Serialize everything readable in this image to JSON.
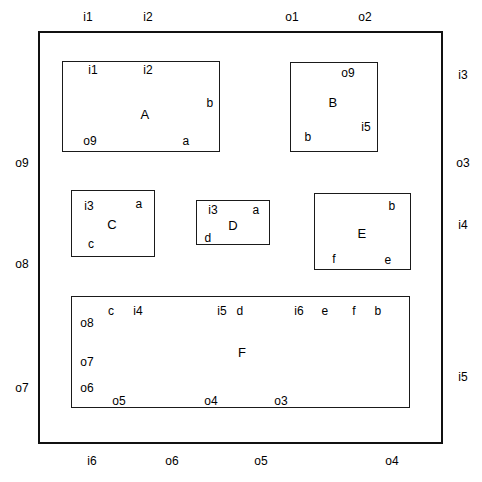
{
  "diagram": {
    "canvas": {
      "width": 482,
      "height": 482,
      "background": "#ffffff"
    },
    "line_color": "#1a1a1a",
    "text_color": "#000000",
    "outer_frame": {
      "name": "outer-frame",
      "x": 38,
      "y": 31,
      "w": 405,
      "h": 413
    },
    "boxes": [
      {
        "id": "A",
        "name": "A",
        "x": 62,
        "y": 61,
        "w": 158,
        "h": 91
      },
      {
        "id": "B",
        "name": "B",
        "x": 290,
        "y": 62,
        "w": 88,
        "h": 90
      },
      {
        "id": "C",
        "name": "C",
        "x": 71,
        "y": 190,
        "w": 84,
        "h": 67
      },
      {
        "id": "D",
        "name": "D",
        "x": 196,
        "y": 200,
        "w": 74,
        "h": 45
      },
      {
        "id": "E",
        "name": "E",
        "x": 314,
        "y": 193,
        "w": 97,
        "h": 77
      },
      {
        "id": "F",
        "name": "F",
        "x": 71,
        "y": 296,
        "w": 339,
        "h": 112
      }
    ],
    "box_names": [
      {
        "text": "A",
        "x": 145,
        "y": 114
      },
      {
        "text": "B",
        "x": 333,
        "y": 102
      },
      {
        "text": "C",
        "x": 112,
        "y": 224
      },
      {
        "text": "D",
        "x": 233,
        "y": 225
      },
      {
        "text": "E",
        "x": 362,
        "y": 233
      },
      {
        "text": "F",
        "x": 242,
        "y": 352
      }
    ],
    "outer_labels": {
      "top": [
        {
          "text": "i1",
          "x": 88,
          "y": 17
        },
        {
          "text": "i2",
          "x": 148,
          "y": 17
        },
        {
          "text": "o1",
          "x": 292,
          "y": 17
        },
        {
          "text": "o2",
          "x": 365,
          "y": 17
        }
      ],
      "bottom": [
        {
          "text": "i6",
          "x": 92,
          "y": 461
        },
        {
          "text": "o6",
          "x": 172,
          "y": 461
        },
        {
          "text": "o5",
          "x": 261,
          "y": 461
        },
        {
          "text": "o4",
          "x": 392,
          "y": 461
        }
      ],
      "left": [
        {
          "text": "o9",
          "x": 22,
          "y": 163
        },
        {
          "text": "o8",
          "x": 22,
          "y": 264
        },
        {
          "text": "o7",
          "x": 22,
          "y": 388
        }
      ],
      "right": [
        {
          "text": "i3",
          "x": 463,
          "y": 75
        },
        {
          "text": "o3",
          "x": 463,
          "y": 163
        },
        {
          "text": "i4",
          "x": 463,
          "y": 225
        },
        {
          "text": "i5",
          "x": 463,
          "y": 377
        }
      ]
    },
    "port_labels": [
      {
        "text": "i1",
        "x": 93,
        "y": 70,
        "box": "A"
      },
      {
        "text": "i2",
        "x": 148,
        "y": 70,
        "box": "A"
      },
      {
        "text": "b",
        "x": 210,
        "y": 103,
        "box": "A"
      },
      {
        "text": "o9",
        "x": 90,
        "y": 141,
        "box": "A"
      },
      {
        "text": "a",
        "x": 186,
        "y": 141,
        "box": "A"
      },
      {
        "text": "o9",
        "x": 348,
        "y": 73,
        "box": "B"
      },
      {
        "text": "i5",
        "x": 366,
        "y": 127,
        "box": "B"
      },
      {
        "text": "b",
        "x": 308,
        "y": 137,
        "box": "B"
      },
      {
        "text": "i3",
        "x": 89,
        "y": 206,
        "box": "C"
      },
      {
        "text": "a",
        "x": 139,
        "y": 204,
        "box": "C"
      },
      {
        "text": "c",
        "x": 91,
        "y": 244,
        "box": "C"
      },
      {
        "text": "i3",
        "x": 213,
        "y": 210,
        "box": "D"
      },
      {
        "text": "a",
        "x": 256,
        "y": 210,
        "box": "D"
      },
      {
        "text": "d",
        "x": 208,
        "y": 238,
        "box": "D"
      },
      {
        "text": "b",
        "x": 392,
        "y": 206,
        "box": "E"
      },
      {
        "text": "f",
        "x": 334,
        "y": 259,
        "box": "E"
      },
      {
        "text": "e",
        "x": 388,
        "y": 260,
        "box": "E"
      },
      {
        "text": "c",
        "x": 111,
        "y": 311,
        "box": "F"
      },
      {
        "text": "i4",
        "x": 138,
        "y": 311,
        "box": "F"
      },
      {
        "text": "i5",
        "x": 222,
        "y": 311,
        "box": "F"
      },
      {
        "text": "d",
        "x": 240,
        "y": 311,
        "box": "F"
      },
      {
        "text": "i6",
        "x": 299,
        "y": 311,
        "box": "F"
      },
      {
        "text": "e",
        "x": 325,
        "y": 311,
        "box": "F"
      },
      {
        "text": "f",
        "x": 354,
        "y": 311,
        "box": "F"
      },
      {
        "text": "b",
        "x": 378,
        "y": 311,
        "box": "F"
      },
      {
        "text": "o8",
        "x": 87,
        "y": 323,
        "box": "F"
      },
      {
        "text": "o7",
        "x": 87,
        "y": 362,
        "box": "F"
      },
      {
        "text": "o6",
        "x": 87,
        "y": 388,
        "box": "F"
      },
      {
        "text": "o5",
        "x": 119,
        "y": 401,
        "box": "F"
      },
      {
        "text": "o4",
        "x": 211,
        "y": 401,
        "box": "F"
      },
      {
        "text": "o3",
        "x": 281,
        "y": 401,
        "box": "F"
      }
    ]
  }
}
